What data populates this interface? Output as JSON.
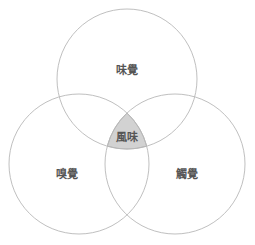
{
  "diagram": {
    "type": "venn-3",
    "sets": [
      {
        "id": "taste",
        "label": "味覺",
        "cx": 127,
        "cy": 79,
        "r": 70,
        "label_x": 127,
        "label_y": 71
      },
      {
        "id": "smell",
        "label": "嗅覺",
        "cx": 79,
        "cy": 164,
        "r": 70,
        "label_x": 67,
        "label_y": 175
      },
      {
        "id": "touch",
        "label": "觸覺",
        "cx": 175,
        "cy": 164,
        "r": 70,
        "label_x": 187,
        "label_y": 175
      }
    ],
    "intersection": {
      "label": "風味",
      "label_x": 127,
      "label_y": 138,
      "fill": "#d2d2d2"
    },
    "colors": {
      "stroke": "#b8b8b8",
      "text": "#555555",
      "background": "#ffffff"
    }
  }
}
